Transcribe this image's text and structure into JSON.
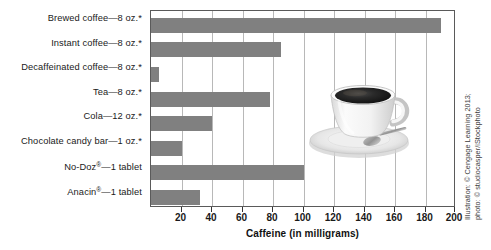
{
  "chart_data": {
    "type": "bar",
    "orientation": "horizontal",
    "title": "",
    "xlabel": "Caffeine (in milligrams)",
    "ylabel": "",
    "xlim": [
      0,
      200
    ],
    "xticks": [
      20,
      40,
      60,
      80,
      100,
      120,
      140,
      160,
      180,
      200
    ],
    "grid": "vertical",
    "legend": "none",
    "bar_color": "#808080",
    "categories": [
      "Brewed coffee—8 oz.*",
      "Instant coffee—8 oz.*",
      "Decaffeinated coffee—8 oz.*",
      "Tea—8 oz.*",
      "Cola—12 oz.*",
      "Chocolate candy bar—1 oz.*",
      "No-Doz®—1 tablet",
      "Anacin®—1 tablet"
    ],
    "values": [
      190,
      85,
      5,
      78,
      40,
      20,
      100,
      32
    ]
  },
  "axis": {
    "x_title": "Caffeine (in milligrams)",
    "tick_labels": [
      "20",
      "40",
      "60",
      "80",
      "100",
      "120",
      "140",
      "160",
      "180",
      "200"
    ]
  },
  "categories": [
    {
      "main": "Brewed coffee",
      "dash": "—",
      "detail": "8 oz.",
      "mark": "*",
      "reg": ""
    },
    {
      "main": "Instant coffee",
      "dash": "—",
      "detail": "8 oz.",
      "mark": "*",
      "reg": ""
    },
    {
      "main": "Decaffeinated coffee",
      "dash": "—",
      "detail": "8 oz.",
      "mark": "*",
      "reg": ""
    },
    {
      "main": "Tea",
      "dash": "—",
      "detail": "8 oz.",
      "mark": "*",
      "reg": ""
    },
    {
      "main": "Cola",
      "dash": "—",
      "detail": "12 oz.",
      "mark": "*",
      "reg": ""
    },
    {
      "main": "Chocolate candy bar",
      "dash": "—",
      "detail": "1 oz.",
      "mark": "*",
      "reg": ""
    },
    {
      "main": "No-Doz",
      "dash": "—",
      "detail": "1 tablet",
      "mark": "",
      "reg": "®"
    },
    {
      "main": "Anacin",
      "dash": "—",
      "detail": "1 tablet",
      "mark": "",
      "reg": "®"
    }
  ],
  "photo": {
    "subject": "cup of black coffee on saucer with spoon",
    "alt": "coffee-cup-photo"
  },
  "credit": {
    "line1": "Illustration: © Cengage Learning 2013;",
    "line2": "photo: © studiocasper/iStockphoto"
  },
  "colors": {
    "bar": "#808080",
    "grid": "#b8b8b8",
    "frame": "#5a5a5a",
    "text": "#1a1a1a"
  }
}
